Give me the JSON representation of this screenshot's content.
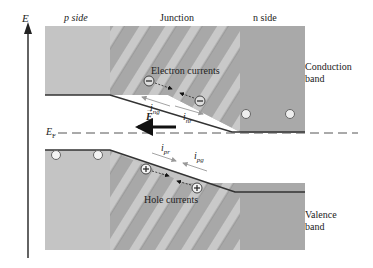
{
  "axis": {
    "label": "E"
  },
  "regions": {
    "p_side": "p side",
    "junction": "Junction",
    "n_side": "n side"
  },
  "bands": {
    "conduction": [
      "Conduction",
      "band"
    ],
    "valence": [
      "Valence",
      "band"
    ]
  },
  "fermi": {
    "label": "E",
    "sub": "F"
  },
  "field": {
    "label": "E"
  },
  "currents": {
    "electron_label": "Electron currents",
    "hole_label": "Hole currents",
    "i_ng": {
      "main": "i",
      "sub": "ng"
    },
    "i_nr": {
      "main": "i",
      "sub": "nr"
    },
    "i_pr": {
      "main": "i",
      "sub": "pr"
    },
    "i_pg": {
      "main": "i",
      "sub": "pg"
    }
  },
  "carriers": {
    "electron_symbol": "−",
    "hole_symbol": "+"
  },
  "colors": {
    "p_band": "#c4c4c4",
    "n_band": "#a9a9a9",
    "stripe_dark": "#9e9e9e",
    "stripe_light": "#c8c8c8",
    "edge": "#333333",
    "fermi_line": "#555555",
    "current_arrow": "#9a9a9a"
  }
}
